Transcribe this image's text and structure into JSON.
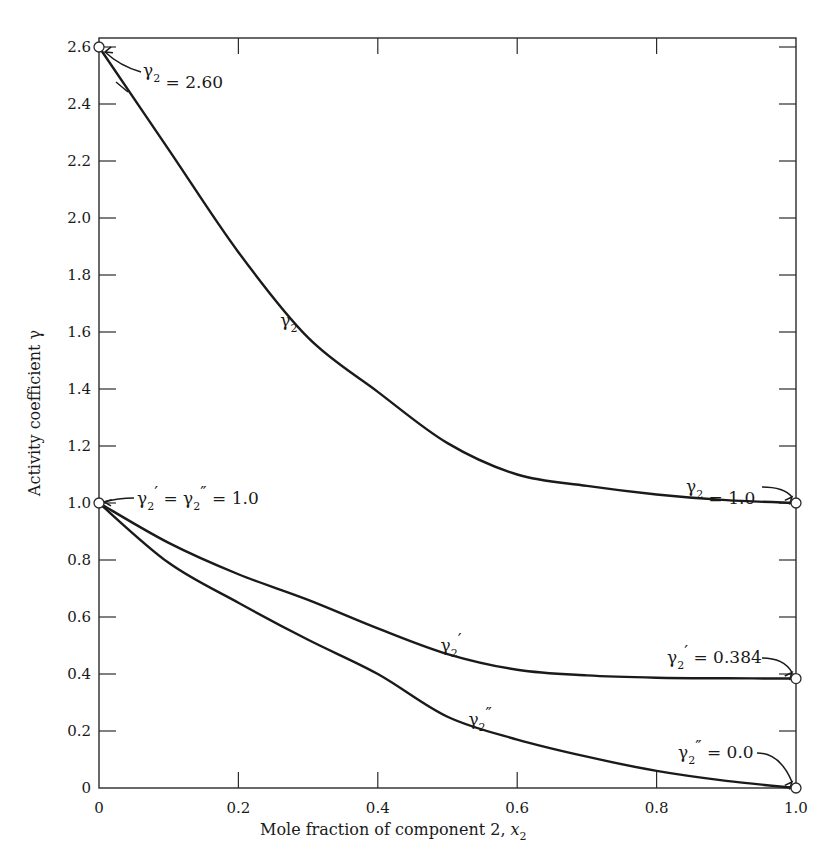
{
  "chart_data": {
    "type": "line",
    "title": "",
    "xlabel": "Mole fraction of component 2, x2",
    "xlabel_main": "Mole fraction of component 2, ",
    "xlabel_var": "x",
    "xlabel_sub": "2",
    "ylabel": "Activity coefficient γ",
    "xlim": [
      0,
      1.0
    ],
    "ylim": [
      0,
      2.6
    ],
    "grid": false,
    "legend": "none (curves labeled inline)",
    "x_ticks": [
      0,
      0.2,
      0.4,
      0.6,
      0.8,
      1.0
    ],
    "x_tick_labels": [
      "0",
      "0.2",
      "0.4",
      "0.6",
      "0.8",
      "1.0"
    ],
    "y_ticks": [
      0,
      0.2,
      0.4,
      0.6,
      0.8,
      1.0,
      1.2,
      1.4,
      1.6,
      1.8,
      2.0,
      2.2,
      2.4,
      2.6
    ],
    "y_tick_labels": [
      "0",
      "0.2",
      "0.4",
      "0.6",
      "0.8",
      "1.0",
      "1.2",
      "1.4",
      "1.6",
      "1.8",
      "2.0",
      "2.2",
      "2.4",
      "2.6"
    ],
    "x": [
      0,
      0.1,
      0.2,
      0.3,
      0.4,
      0.5,
      0.6,
      0.7,
      0.8,
      0.9,
      1.0
    ],
    "series": [
      {
        "name": "γ2",
        "values": [
          2.6,
          2.24,
          1.88,
          1.58,
          1.39,
          1.21,
          1.1,
          1.06,
          1.03,
          1.01,
          1.0
        ]
      },
      {
        "name": "γ2'",
        "values": [
          1.0,
          0.86,
          0.75,
          0.66,
          0.56,
          0.47,
          0.415,
          0.395,
          0.387,
          0.385,
          0.384
        ]
      },
      {
        "name": "γ2''",
        "values": [
          1.0,
          0.79,
          0.65,
          0.52,
          0.4,
          0.25,
          0.17,
          0.11,
          0.06,
          0.025,
          0.0
        ]
      }
    ],
    "curve_labels": [
      {
        "series": "γ2",
        "base": "γ",
        "sub": "2",
        "prime": "",
        "x": 0.26,
        "y": 1.62
      },
      {
        "series": "γ2'",
        "base": "γ",
        "sub": "2",
        "prime": "′",
        "x": 0.49,
        "y": 0.48
      },
      {
        "series": "γ2''",
        "base": "γ",
        "sub": "2",
        "prime": "″",
        "x": 0.53,
        "y": 0.22
      }
    ],
    "annotations": [
      {
        "text": "γ2 = 2.60",
        "base": "γ",
        "sub": "2",
        "prime": "",
        "rhs": "= 2.60",
        "point": [
          0,
          2.6
        ]
      },
      {
        "text": "γ2' = γ2'' = 1.0",
        "base": "γ",
        "sub": "2",
        "prime": "′",
        "rhs": "= γ",
        "sub2": "2",
        "prime2": "″",
        "rhs2": "= 1.0",
        "point": [
          0,
          1.0
        ]
      },
      {
        "text": "γ2 = 1.0",
        "base": "γ",
        "sub": "2",
        "prime": "",
        "rhs": "= 1.0",
        "point": [
          1.0,
          1.0
        ]
      },
      {
        "text": "γ2' = 0.384",
        "base": "γ",
        "sub": "2",
        "prime": "′",
        "rhs": "= 0.384",
        "point": [
          1.0,
          0.384
        ]
      },
      {
        "text": "γ2'' = 0.0",
        "base": "γ",
        "sub": "2",
        "prime": "″",
        "rhs": "= 0.0",
        "point": [
          1.0,
          0.0
        ]
      }
    ],
    "colors": {
      "line": "#1a1a1a",
      "axis": "#2a2a2a",
      "background": "#ffffff"
    }
  }
}
